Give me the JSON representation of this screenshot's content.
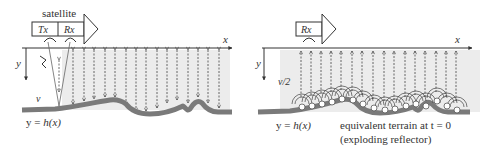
{
  "left_panel": {
    "satellite_label": "satellite",
    "tx_label": "Tx",
    "rx_label": "Rx",
    "x_axis_label": "x",
    "y_axis_label": "y",
    "velocity_label": "v",
    "terrain_label_prefix": "y = ",
    "terrain_label_func": "h(x)"
  },
  "right_panel": {
    "rx_label": "Rx",
    "x_axis_label": "x",
    "y_axis_label": "y",
    "velocity_label": "v/2",
    "terrain_label_prefix": "y = ",
    "terrain_label_func": "h(x)",
    "caption_line1": "equivalent terrain at t = 0",
    "caption_line2": "(exploding reflector)"
  },
  "colors": {
    "terrain": "#7a7a7a",
    "shade": "#ececec",
    "line": "#333333"
  }
}
